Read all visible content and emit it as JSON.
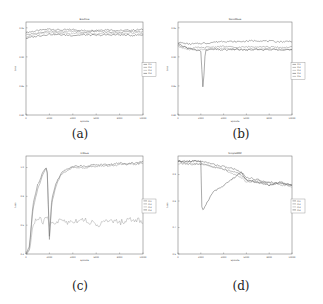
{
  "figure": {
    "captions": [
      "(a)",
      "(b)",
      "(c)",
      "(d)"
    ]
  },
  "chart_data": [
    {
      "type": "line",
      "panel": "(a)",
      "title": "BoxFlow",
      "xlabel": "Episode",
      "ylabel": "Loss",
      "xticks": [
        "0",
        "2000",
        "4000",
        "6000",
        "8000",
        "10000"
      ],
      "yticks": [
        "0.80",
        "0.85",
        "0.90",
        "0.95"
      ],
      "xlim": [
        0,
        10000
      ],
      "ylim": [
        0.8,
        0.96
      ],
      "legend": [
        "m1",
        "m2",
        "m3",
        "m4"
      ],
      "legend_position": "right",
      "grid": false,
      "series_desc": "Four noisy lines all clustered near top of plot, around 0.94-0.95",
      "x": [
        0,
        1000,
        2000,
        3000,
        4000,
        5000,
        6000,
        7000,
        8000,
        9000,
        10000
      ],
      "series": [
        {
          "name": "m1",
          "values": [
            0.942,
            0.945,
            0.948,
            0.946,
            0.947,
            0.945,
            0.946,
            0.947,
            0.945,
            0.946,
            0.947
          ]
        },
        {
          "name": "m2",
          "values": [
            0.938,
            0.941,
            0.944,
            0.943,
            0.944,
            0.942,
            0.944,
            0.943,
            0.942,
            0.944,
            0.943
          ]
        },
        {
          "name": "m3",
          "values": [
            0.935,
            0.939,
            0.942,
            0.941,
            0.94,
            0.941,
            0.939,
            0.941,
            0.94,
            0.941,
            0.94
          ]
        },
        {
          "name": "m4",
          "values": [
            0.932,
            0.936,
            0.939,
            0.938,
            0.937,
            0.938,
            0.937,
            0.938,
            0.938,
            0.937,
            0.938
          ]
        }
      ]
    },
    {
      "type": "line",
      "panel": "(b)",
      "title": "NanoMaze",
      "xlabel": "Episode",
      "ylabel": "Loss",
      "xticks": [
        "0",
        "2000",
        "4000",
        "6000",
        "8000",
        "10000"
      ],
      "yticks": [
        "0.80",
        "0.85",
        "0.90",
        "0.95"
      ],
      "xlim": [
        0,
        10000
      ],
      "ylim": [
        0.8,
        0.96
      ],
      "legend": [
        "m1",
        "m2",
        "m3",
        "m4",
        "m5"
      ],
      "legend_position": "right",
      "grid": false,
      "series_desc": "Noisy lines around 0.91-0.92, one line with sharp dip near x=2000",
      "x": [
        0,
        1000,
        2000,
        2200,
        2400,
        3000,
        4000,
        5000,
        6000,
        7000,
        8000,
        9000,
        10000
      ],
      "series": [
        {
          "name": "m1",
          "values": [
            0.925,
            0.922,
            0.923,
            0.924,
            0.923,
            0.925,
            0.927,
            0.926,
            0.927,
            0.928,
            0.927,
            0.926,
            0.927
          ]
        },
        {
          "name": "m2",
          "values": [
            0.92,
            0.915,
            0.916,
            0.915,
            0.916,
            0.917,
            0.918,
            0.916,
            0.917,
            0.918,
            0.917,
            0.916,
            0.917
          ]
        },
        {
          "name": "m3",
          "values": [
            0.918,
            0.912,
            0.913,
            0.912,
            0.913,
            0.913,
            0.914,
            0.913,
            0.912,
            0.913,
            0.914,
            0.913,
            0.912
          ]
        },
        {
          "name": "m4",
          "values": [
            0.922,
            0.914,
            0.91,
            0.842,
            0.912,
            0.913,
            0.912,
            0.913,
            0.912,
            0.913,
            0.912,
            0.913,
            0.912
          ]
        }
      ]
    },
    {
      "type": "line",
      "panel": "(c)",
      "title": "X-Maze",
      "xlabel": "Episode",
      "ylabel": "Loss",
      "xticks": [
        "0",
        "2000",
        "4000",
        "6000",
        "8000",
        "10000"
      ],
      "yticks": [
        "0.4",
        "0.6",
        "0.8",
        "1.0"
      ],
      "xlim": [
        0,
        10000
      ],
      "ylim": [
        0.4,
        1.08
      ],
      "legend": [
        "m1",
        "m2",
        "m3",
        "m4"
      ],
      "legend_position": "right",
      "grid": false,
      "series_desc": "Two lines rise rapidly to ~1.0 by 1800, drop sharply at ~2000, recover to ~1.0 by 4000; one line noisy around 0.62",
      "x": [
        0,
        300,
        600,
        1000,
        1500,
        1800,
        2000,
        2200,
        2600,
        3000,
        3500,
        4000,
        5000,
        6000,
        7000,
        8000,
        9000,
        10000
      ],
      "series": [
        {
          "name": "m1",
          "values": [
            0.4,
            0.45,
            0.75,
            0.88,
            0.98,
            1.01,
            0.52,
            0.78,
            0.9,
            0.96,
            0.99,
            1.01,
            1.01,
            1.02,
            1.02,
            1.03,
            1.03,
            1.04
          ]
        },
        {
          "name": "m2",
          "values": [
            0.4,
            0.44,
            0.72,
            0.85,
            0.96,
            1.0,
            0.5,
            0.75,
            0.88,
            0.95,
            0.98,
            1.0,
            1.0,
            1.01,
            1.01,
            1.02,
            1.02,
            1.03
          ]
        },
        {
          "name": "m3",
          "values": [
            0.4,
            0.42,
            0.6,
            0.65,
            0.62,
            0.66,
            0.6,
            0.63,
            0.61,
            0.64,
            0.62,
            0.63,
            0.64,
            0.6,
            0.63,
            0.62,
            0.64,
            0.63
          ]
        }
      ]
    },
    {
      "type": "line",
      "panel": "(d)",
      "title": "SimpleMDP",
      "xlabel": "Episode",
      "ylabel": "Loss",
      "xticks": [
        "0",
        "2000",
        "4000",
        "6000",
        "8000",
        "10000"
      ],
      "yticks": [
        "0.6",
        "0.7",
        "0.8",
        "0.9"
      ],
      "xlim": [
        0,
        10000
      ],
      "ylim": [
        0.6,
        0.97
      ],
      "legend": [
        "m1",
        "m2",
        "m3",
        "m4"
      ],
      "legend_position": "right",
      "grid": false,
      "series_desc": "Three lines start near 0.95 and decline to ~0.86 by 10000; one line drops sharply at 2000 to ~0.76 then climbs to meet others around 6000",
      "x": [
        0,
        1000,
        2000,
        2100,
        3000,
        4000,
        5000,
        5500,
        6000,
        7000,
        8000,
        9000,
        10000
      ],
      "series": [
        {
          "name": "m1",
          "values": [
            0.95,
            0.95,
            0.95,
            0.95,
            0.94,
            0.93,
            0.92,
            0.91,
            0.89,
            0.88,
            0.87,
            0.87,
            0.86
          ]
        },
        {
          "name": "m2",
          "values": [
            0.95,
            0.94,
            0.94,
            0.94,
            0.93,
            0.92,
            0.91,
            0.9,
            0.88,
            0.87,
            0.87,
            0.86,
            0.86
          ]
        },
        {
          "name": "m3",
          "values": [
            0.94,
            0.94,
            0.94,
            0.94,
            0.93,
            0.92,
            0.9,
            0.89,
            0.87,
            0.88,
            0.86,
            0.87,
            0.85
          ]
        },
        {
          "name": "m4",
          "values": [
            0.95,
            0.95,
            0.95,
            0.76,
            0.83,
            0.86,
            0.89,
            0.91,
            0.88,
            0.87,
            0.86,
            0.87,
            0.86
          ]
        }
      ]
    }
  ]
}
